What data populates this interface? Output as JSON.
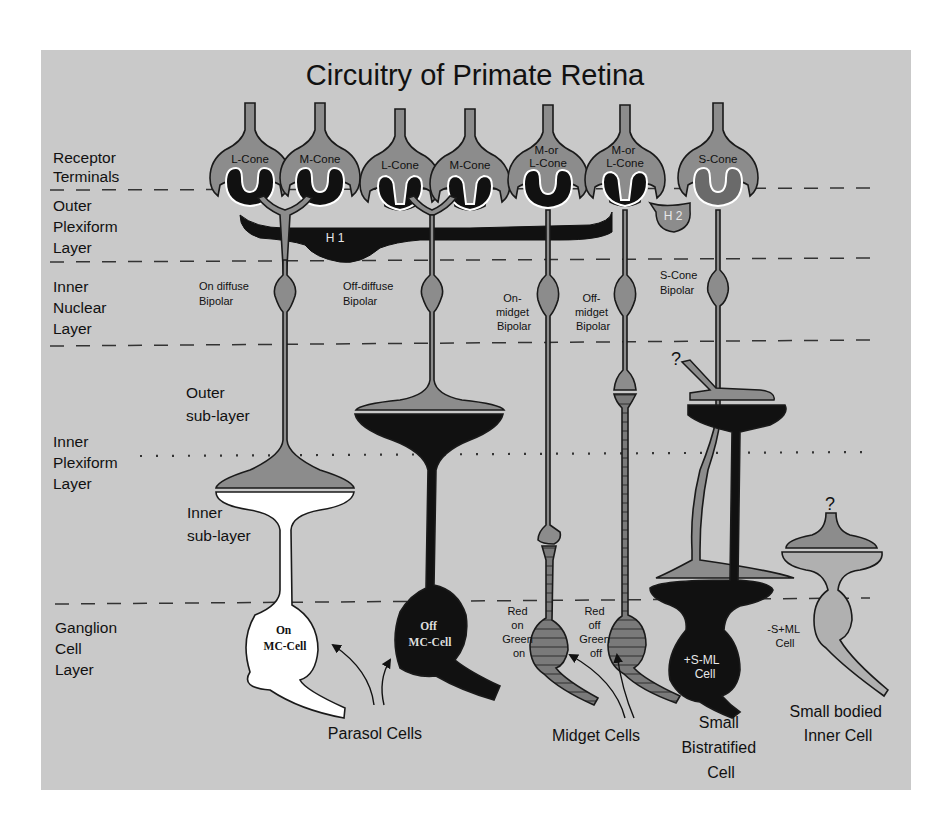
{
  "title": "Circuitry of Primate Retina",
  "colors": {
    "page_background": "#ffffff",
    "panel_background": "#c9c9c9",
    "neuron_gray": "#8c8c8c",
    "neuron_light": "#b0b0b0",
    "neuron_black": "#111111",
    "neuron_white": "#ffffff",
    "outline": "#1a1a1a"
  },
  "layers": [
    {
      "id": "receptor-terminals",
      "lines": [
        "Receptor",
        "Terminals"
      ]
    },
    {
      "id": "outer-plexiform",
      "lines": [
        "Outer",
        "Plexiform",
        "Layer"
      ]
    },
    {
      "id": "inner-nuclear",
      "lines": [
        "Inner",
        "Nuclear",
        "Layer"
      ]
    },
    {
      "id": "inner-plexiform",
      "lines": [
        "Inner",
        "Plexiform",
        "Layer"
      ]
    },
    {
      "id": "ganglion-cell",
      "lines": [
        "Ganglion",
        "Cell",
        "Layer"
      ]
    }
  ],
  "sublayers": {
    "outer": [
      "Outer",
      "sub-layer"
    ],
    "inner": [
      "Inner",
      "sub-layer"
    ]
  },
  "cones": [
    {
      "id": "l-cone-1",
      "lines": [
        "L-Cone"
      ]
    },
    {
      "id": "m-cone-1",
      "lines": [
        "M-Cone"
      ]
    },
    {
      "id": "l-cone-2",
      "lines": [
        "L-Cone"
      ]
    },
    {
      "id": "m-cone-2",
      "lines": [
        "M-Cone"
      ]
    },
    {
      "id": "ml-cone-1",
      "lines": [
        "M-or",
        "L-Cone"
      ]
    },
    {
      "id": "ml-cone-2",
      "lines": [
        "M-or",
        "L-Cone"
      ]
    },
    {
      "id": "s-cone",
      "lines": [
        "S-Cone"
      ]
    }
  ],
  "horizontal_cells": {
    "h1": "H 1",
    "h2": "H 2"
  },
  "bipolars": [
    {
      "id": "on-diffuse",
      "lines": [
        "On diffuse",
        "Bipolar"
      ]
    },
    {
      "id": "off-diffuse",
      "lines": [
        "Off-diffuse",
        "Bipolar"
      ]
    },
    {
      "id": "on-midget",
      "lines": [
        "On-",
        "midget",
        "Bipolar"
      ]
    },
    {
      "id": "off-midget",
      "lines": [
        "Off-",
        "midget",
        "Bipolar"
      ]
    },
    {
      "id": "s-cone-bipolar",
      "lines": [
        "S-Cone",
        "Bipolar"
      ]
    }
  ],
  "unknown_markers": [
    "?",
    "?"
  ],
  "ganglion_cells": [
    {
      "id": "on-mc",
      "lines": [
        "On",
        "MC-Cell"
      ]
    },
    {
      "id": "off-mc",
      "lines": [
        "Off",
        "MC-Cell"
      ]
    },
    {
      "id": "red-on-green-on",
      "lines": [
        "Red",
        "on",
        "Green",
        "on"
      ]
    },
    {
      "id": "red-off-green-off",
      "lines": [
        "Red",
        "off",
        "Green",
        "off"
      ]
    },
    {
      "id": "plus-s-minus-ml",
      "lines": [
        "+S-ML",
        "Cell"
      ]
    },
    {
      "id": "minus-s-plus-ml",
      "lines": [
        "-S+ML",
        "Cell"
      ]
    }
  ],
  "cell_groups": [
    {
      "id": "parasol",
      "lines": [
        "Parasol Cells"
      ]
    },
    {
      "id": "midget",
      "lines": [
        "Midget Cells"
      ]
    },
    {
      "id": "small-bistratified",
      "lines": [
        "Small",
        "Bistratified",
        "Cell"
      ]
    },
    {
      "id": "small-bodied-inner",
      "lines": [
        "Small bodied",
        "Inner Cell"
      ]
    }
  ]
}
